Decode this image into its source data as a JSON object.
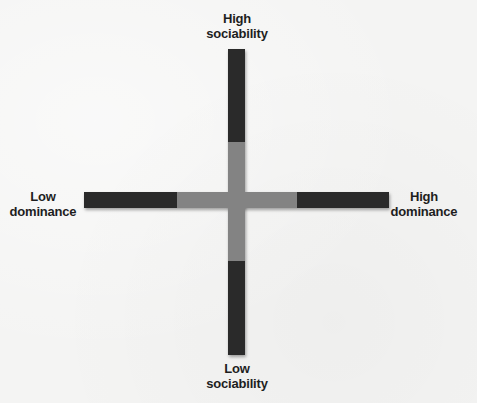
{
  "diagram": {
    "type": "quadrant-axes",
    "axes": {
      "vertical": {
        "top_label_line1": "High",
        "top_label_line2": "sociability",
        "bottom_label_line1": "Low",
        "bottom_label_line2": "sociability"
      },
      "horizontal": {
        "left_label_line1": "Low",
        "left_label_line2": "dominance",
        "right_label_line1": "High",
        "right_label_line2": "dominance"
      }
    },
    "colors": {
      "outer_bar": "#2a2a2a",
      "inner_segment": "#838383",
      "background": "#f4f4f3",
      "text": "#1e1e1e"
    }
  }
}
